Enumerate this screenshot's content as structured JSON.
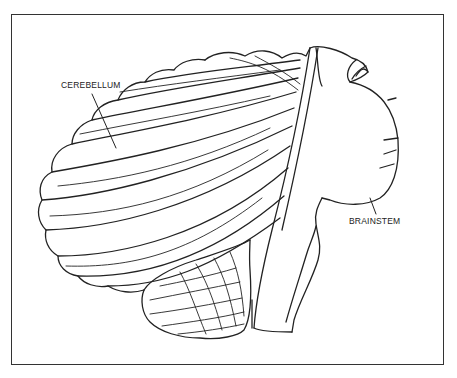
{
  "figure": {
    "type": "anatomical line illustration",
    "labels": {
      "cerebellum": "CEREBELLUM",
      "brainstem": "BRAINSTEM"
    },
    "colors": {
      "line": "#222222",
      "background": "#ffffff",
      "frame": "#333333"
    }
  }
}
